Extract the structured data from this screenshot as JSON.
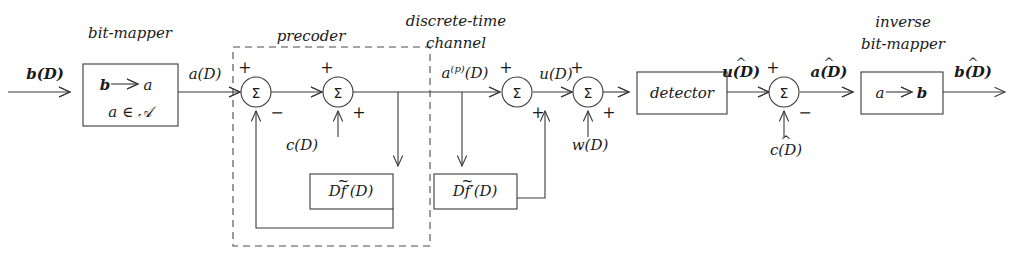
{
  "diagram": {
    "title_bit_mapper": "bit-mapper",
    "title_precoder": "precoder",
    "title_channel_line1": "discrete-time",
    "title_channel_line2": "channel",
    "title_inverse_line1": "inverse",
    "title_inverse_line2": "bit-mapper",
    "input_signal": "b(D)",
    "mapper_rule_from": "b",
    "mapper_rule_to": "a",
    "mapper_alphabet": "a ∈ 𝒜",
    "signal_a": "a(D)",
    "signal_ap_base": "a",
    "signal_ap_sup": "(p)",
    "signal_ap_tail": "(D)",
    "signal_c": "c(D)",
    "signal_u": "u(D)",
    "signal_w": "w(D)",
    "signal_u_hat": "u(D)",
    "signal_c_hat": "c(D)",
    "signal_a_hat": "a(D)",
    "signal_b_hat": "b(D)",
    "detector_label": "detector",
    "filter_label_prefix": "D",
    "filter_label_sym": "f",
    "filter_label_suffix": "′(D)",
    "inv_rule_from": "a",
    "inv_rule_to": "b",
    "sigma_glyph": "Σ",
    "plus": "+",
    "minus": "−",
    "arrow_glyph": "→",
    "colors": {
      "line": "#3a3a3a",
      "dashed": "#4a4a4a",
      "text": "#1a1a1a",
      "background": "#ffffff"
    }
  }
}
